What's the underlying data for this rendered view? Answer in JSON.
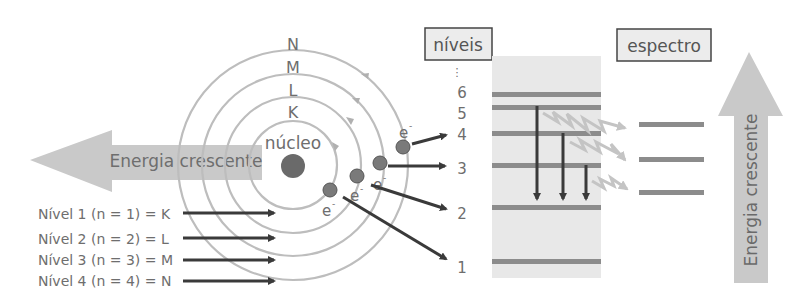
{
  "diagram": {
    "orbit_labels": [
      "K",
      "L",
      "M",
      "N"
    ],
    "nucleus_label": "núcleo",
    "electron_label": "e",
    "electron_charge": "-",
    "left_arrow_label": "Energia crescente",
    "right_arrow_label": "Energia crescente",
    "levels_box_label": "níveis",
    "spectrum_box_label": "espectro",
    "level_dots": "⋮",
    "level_numbers": [
      "1",
      "2",
      "3",
      "4",
      "5",
      "6"
    ],
    "legend": [
      "Nível 1 (n = 1) = K",
      "Nível 2 (n = 2) = L",
      "Nível 3 (n = 3) = M",
      "Nível 4 (n = 4) = N"
    ],
    "colors": {
      "arrow_fill": "#c8c8c8",
      "orbit": "#bdbdbd",
      "nucleus": "#6a6a6a",
      "electron": "#7a7a7a",
      "dark_arrow": "#3a3a3a",
      "level_band": "#e6e6e6",
      "level_line": "#8c8c8c",
      "spectrum_line": "#8c8c8c",
      "photon": "#c4c4c4"
    }
  }
}
